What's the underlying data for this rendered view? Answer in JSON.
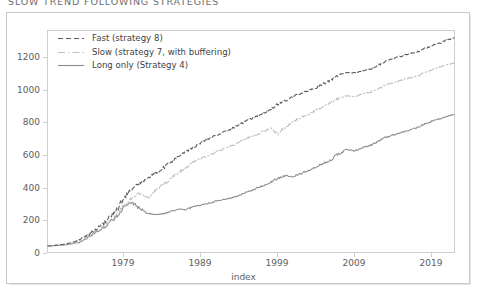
{
  "title": "SLOW TREND FOLLOWING STRATEGIES",
  "axis": {
    "xlabel": "index",
    "yticks": [
      "0",
      "200",
      "400",
      "600",
      "800",
      "1000",
      "1200"
    ],
    "xticks": [
      "1979",
      "1989",
      "1999",
      "2009",
      "2019"
    ]
  },
  "legend": {
    "items": [
      {
        "label": "Fast (strategy 8)",
        "style": "dashed",
        "color": "#5a5a5a"
      },
      {
        "label": "Slow (strategy 7, with buffering)",
        "style": "dashdot",
        "color": "#bdbdbd"
      },
      {
        "label": "Long only (Strategy 4)",
        "style": "solid",
        "color": "#8c8c8c"
      }
    ]
  },
  "colors": {
    "fast": "#5a5a5a",
    "slow": "#bdbdbd",
    "long_only": "#8c8c8c",
    "frame": "#cfcfcf",
    "card_border": "#c9c9c9",
    "text": "#5d5d5d",
    "background": "#ffffff"
  },
  "chart_data": {
    "type": "line",
    "title": "SLOW TREND FOLLOWING STRATEGIES",
    "xlabel": "index",
    "ylabel": "",
    "xlim": [
      1970,
      2023
    ],
    "ylim": [
      -40,
      1340
    ],
    "grid": false,
    "legend_position": "upper-left",
    "xticks": [
      1979,
      1989,
      1999,
      2009,
      2019
    ],
    "yticks": [
      0,
      200,
      400,
      600,
      800,
      1000,
      1200
    ],
    "x": [
      1970,
      1971,
      1972,
      1973,
      1974,
      1975,
      1976,
      1977,
      1978,
      1979,
      1980,
      1981,
      1982,
      1983,
      1984,
      1985,
      1986,
      1987,
      1988,
      1989,
      1990,
      1991,
      1992,
      1993,
      1994,
      1995,
      1996,
      1997,
      1998,
      1999,
      2000,
      2001,
      2002,
      2003,
      2004,
      2005,
      2006,
      2007,
      2008,
      2009,
      2010,
      2011,
      2012,
      2013,
      2014,
      2015,
      2016,
      2017,
      2018,
      2019,
      2020,
      2021,
      2022,
      2023
    ],
    "series": [
      {
        "name": "Fast (strategy 8)",
        "style": "dashed",
        "color": "#5a5a5a",
        "values": [
          0,
          5,
          10,
          20,
          35,
          60,
          95,
          130,
          170,
          230,
          300,
          355,
          390,
          420,
          450,
          480,
          520,
          555,
          585,
          615,
          645,
          665,
          690,
          710,
          730,
          755,
          780,
          800,
          825,
          850,
          880,
          905,
          930,
          950,
          965,
          985,
          1010,
          1035,
          1065,
          1080,
          1075,
          1090,
          1100,
          1120,
          1150,
          1165,
          1180,
          1195,
          1205,
          1225,
          1245,
          1260,
          1280,
          1295
        ]
      },
      {
        "name": "Slow (strategy 7, with buffering)",
        "style": "dashdot",
        "color": "#bdbdbd",
        "values": [
          0,
          4,
          8,
          16,
          28,
          50,
          80,
          110,
          145,
          195,
          255,
          300,
          330,
          300,
          340,
          380,
          420,
          455,
          490,
          520,
          545,
          565,
          585,
          605,
          625,
          650,
          670,
          690,
          710,
          730,
          700,
          740,
          775,
          800,
          820,
          845,
          870,
          895,
          920,
          935,
          930,
          945,
          955,
          975,
          1000,
          1015,
          1030,
          1045,
          1055,
          1075,
          1095,
          1110,
          1125,
          1140
        ]
      },
      {
        "name": "Long only (Strategy 4)",
        "style": "solid",
        "color": "#8c8c8c",
        "values": [
          0,
          3,
          6,
          12,
          22,
          45,
          78,
          105,
          140,
          185,
          245,
          270,
          235,
          205,
          195,
          200,
          215,
          230,
          225,
          245,
          255,
          265,
          280,
          290,
          300,
          315,
          335,
          355,
          375,
          395,
          420,
          440,
          430,
          450,
          470,
          490,
          515,
          540,
          575,
          600,
          590,
          610,
          625,
          650,
          675,
          690,
          705,
          720,
          735,
          755,
          775,
          790,
          805,
          820
        ]
      }
    ]
  }
}
